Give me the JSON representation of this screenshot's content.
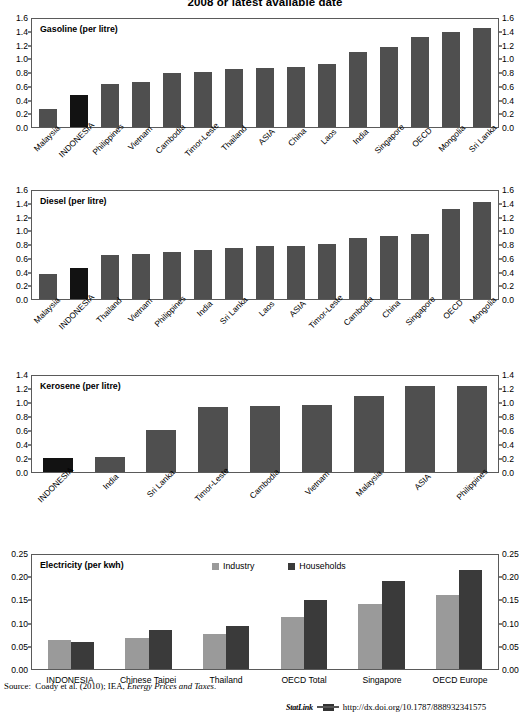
{
  "title": "2008 or latest available date",
  "source": {
    "label": "Source:",
    "text_plain": "Coady et al. (2010); IEA, ",
    "text_italic": "Energy Prices and Taxes",
    "text_end": "."
  },
  "statlink": {
    "word": "StatLink",
    "url": "http://dx.doi.org/10.1787/888932341575"
  },
  "legend": {
    "industry": "Industry",
    "households": "Households"
  },
  "chart_data": [
    {
      "type": "bar",
      "title": "Gasoline (per litre)",
      "xlabel": "",
      "ylabel": "",
      "ylim": [
        0.0,
        1.6
      ],
      "yticks": [
        "0.0",
        "0.2",
        "0.4",
        "0.6",
        "0.8",
        "1.0",
        "1.2",
        "1.4",
        "1.6"
      ],
      "grid": false,
      "highlight_category": "INDONESIA",
      "categories": [
        "Malaysia",
        "INDONESIA",
        "Philippines",
        "Vietnam",
        "Cambodia",
        "Timor-Leste",
        "Thailand",
        "ASIA",
        "China",
        "Laos",
        "India",
        "Singapore",
        "OECD",
        "Mongolia",
        "Sri Lanka"
      ],
      "values": [
        0.26,
        0.47,
        0.64,
        0.66,
        0.8,
        0.81,
        0.86,
        0.88,
        0.89,
        0.93,
        1.11,
        1.19,
        1.34,
        1.41,
        1.46
      ]
    },
    {
      "type": "bar",
      "title": "Diesel  (per litre)",
      "xlabel": "",
      "ylabel": "",
      "ylim": [
        0.0,
        1.6
      ],
      "yticks": [
        "0.0",
        "0.2",
        "0.4",
        "0.6",
        "0.8",
        "1.0",
        "1.2",
        "1.4",
        "1.6"
      ],
      "grid": false,
      "highlight_category": "INDONESIA",
      "categories": [
        "Malaysia",
        "INDONESIA",
        "Thailand",
        "Vietnam",
        "Philippines",
        "India",
        "Sri Lanka",
        "Laos",
        "ASIA",
        "Timor-Leste",
        "Cambodia",
        "China",
        "Singapore",
        "OECD",
        "Mongolia"
      ],
      "values": [
        0.37,
        0.46,
        0.65,
        0.66,
        0.7,
        0.72,
        0.76,
        0.78,
        0.78,
        0.82,
        0.91,
        0.93,
        0.97,
        1.33,
        1.44
      ]
    },
    {
      "type": "bar",
      "title": "Kerosene  (per litre)",
      "xlabel": "",
      "ylabel": "",
      "ylim": [
        0.0,
        1.4
      ],
      "yticks": [
        "0.0",
        "0.2",
        "0.4",
        "0.6",
        "0.8",
        "1.0",
        "1.2",
        "1.4"
      ],
      "grid": false,
      "highlight_category": "INDONESIA",
      "categories": [
        "INDONESIA",
        "India",
        "Sri Lanka",
        "Timor-Leste",
        "Cambodia",
        "Vietnam",
        "Malaysia",
        "ASIA",
        "Philippines"
      ],
      "values": [
        0.21,
        0.22,
        0.61,
        0.95,
        0.96,
        0.98,
        1.11,
        1.25,
        1.26
      ]
    },
    {
      "type": "bar",
      "title": "Electricity (per kwh)",
      "xlabel": "",
      "ylabel": "",
      "ylim": [
        0.0,
        0.25
      ],
      "yticks": [
        "0.00",
        "0.05",
        "0.10",
        "0.15",
        "0.20",
        "0.25"
      ],
      "grid": false,
      "categories": [
        "INDONESIA",
        "Chinese Taipei",
        "Thailand",
        "OECD Total",
        "Singapore",
        "OECD Europe"
      ],
      "series": [
        {
          "name": "Industry",
          "values": [
            0.063,
            0.067,
            0.076,
            0.113,
            0.143,
            0.162
          ]
        },
        {
          "name": "Households",
          "values": [
            0.06,
            0.086,
            0.094,
            0.152,
            0.192,
            0.218
          ]
        }
      ]
    }
  ]
}
